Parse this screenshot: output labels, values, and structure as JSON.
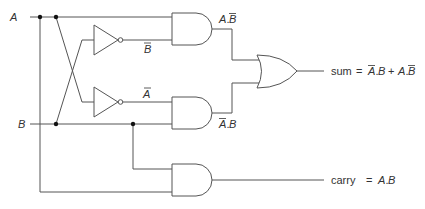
{
  "diagram": {
    "inputs": [
      {
        "id": "A",
        "label": "A"
      },
      {
        "id": "B",
        "label": "B"
      }
    ],
    "gates": [
      {
        "id": "not1",
        "type": "NOT",
        "input": "A",
        "output_label": "B̄"
      },
      {
        "id": "not2",
        "type": "NOT",
        "input": "B",
        "output_label": "Ā"
      },
      {
        "id": "and1",
        "type": "AND",
        "inputs": [
          "A",
          "B̄"
        ],
        "output_label": "A.B̄"
      },
      {
        "id": "and2",
        "type": "AND",
        "inputs": [
          "Ā",
          "B"
        ],
        "output_label": "Ā.B"
      },
      {
        "id": "or1",
        "type": "OR",
        "inputs": [
          "A.B̄",
          "Ā.B"
        ],
        "output": "sum"
      },
      {
        "id": "and3",
        "type": "AND",
        "inputs": [
          "A",
          "B"
        ],
        "output": "carry"
      }
    ],
    "labels": {
      "input_a": "A",
      "input_b": "B",
      "not1_out": "B",
      "not2_out": "A",
      "and1_out_a": "A",
      "and1_out_b": "B",
      "and2_out_a": "A",
      "and2_out_b": "B",
      "sum_word": "sum",
      "sum_eq": "=",
      "sum_t1_a": "A",
      "sum_t1_b": "B",
      "sum_plus": "+",
      "sum_t2_a": "A",
      "sum_t2_b": "B",
      "carry_word": "carry",
      "carry_eq": "=",
      "carry_a": "A",
      "carry_b": "B",
      "dot": "."
    },
    "outputs": [
      {
        "id": "sum",
        "expression": "sum = Ā.B + A.B̄"
      },
      {
        "id": "carry",
        "expression": "carry = A.B"
      }
    ],
    "colors": {
      "wire": "#555555",
      "junction": "#111111",
      "text": "#333333",
      "background": "#ffffff"
    }
  }
}
